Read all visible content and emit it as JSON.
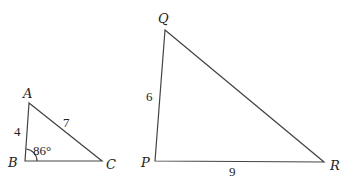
{
  "triangles": [
    {
      "name": "ABC",
      "vertices": {
        "A": {
          "label": "A",
          "x": 29,
          "y": 103
        },
        "B": {
          "label": "B",
          "x": 25,
          "y": 161
        },
        "C": {
          "label": "C",
          "x": 102,
          "y": 161
        }
      },
      "sides": {
        "AB": "4",
        "AC": "7"
      },
      "angle_B": "86°"
    },
    {
      "name": "PQR",
      "vertices": {
        "Q": {
          "label": "Q",
          "x": 165,
          "y": 30
        },
        "P": {
          "label": "P",
          "x": 155,
          "y": 161
        },
        "R": {
          "label": "R",
          "x": 324,
          "y": 162
        }
      },
      "sides": {
        "PQ": "6",
        "PR": "9"
      }
    }
  ]
}
